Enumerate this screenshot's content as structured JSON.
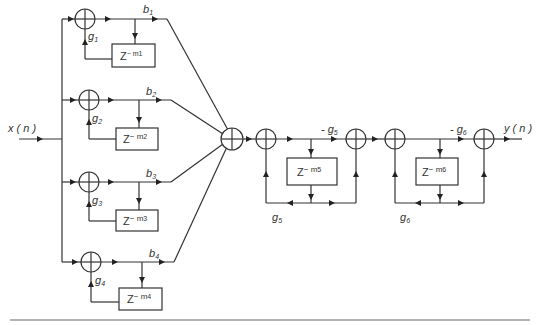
{
  "diagram": {
    "title": "",
    "input_label": "x ( n )",
    "output_label": "y ( n )",
    "comb_branches": [
      {
        "id": 1,
        "gain_label": "g",
        "gain_sub": "1",
        "output_label": "b",
        "output_sub": "1",
        "delay_label": "Z",
        "delay_exp": "− m",
        "delay_sub": "1"
      },
      {
        "id": 2,
        "gain_label": "g",
        "gain_sub": "2",
        "output_label": "b",
        "output_sub": "2",
        "delay_label": "Z",
        "delay_exp": "− m",
        "delay_sub": "2"
      },
      {
        "id": 3,
        "gain_label": "g",
        "gain_sub": "3",
        "output_label": "b",
        "output_sub": "3",
        "delay_label": "Z",
        "delay_exp": "− m",
        "delay_sub": "3"
      },
      {
        "id": 4,
        "gain_label": "g",
        "gain_sub": "4",
        "output_label": "b",
        "output_sub": "4",
        "delay_label": "Z",
        "delay_exp": "− m",
        "delay_sub": "4"
      }
    ],
    "allpass_sections": [
      {
        "id": 5,
        "forward_gain": "- g",
        "forward_sub": "5",
        "feedback_gain": "g",
        "feedback_sub": "5",
        "delay_label": "Z",
        "delay_exp": "− m",
        "delay_sub": "5"
      },
      {
        "id": 6,
        "forward_gain": "- g",
        "forward_sub": "6",
        "feedback_gain": "g",
        "feedback_sub": "6",
        "delay_label": "Z",
        "delay_exp": "− m",
        "delay_sub": "6"
      }
    ]
  }
}
